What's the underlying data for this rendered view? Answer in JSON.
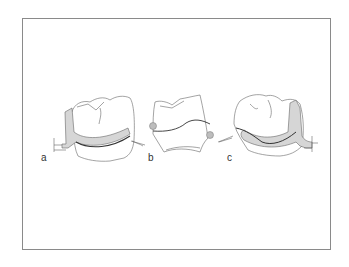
{
  "figure": {
    "panels": [
      {
        "id": "a",
        "label": "a",
        "description": "tooth with clasp arm (left view)"
      },
      {
        "id": "b",
        "label": "b",
        "description": "tooth with survey line (center view)"
      },
      {
        "id": "c",
        "label": "c",
        "description": "tooth with clasp arm (right view)"
      }
    ],
    "colors": {
      "line": "#555555",
      "clasp_fill": "#d6d6d6",
      "frame": "#8a8a8a",
      "rest_fill": "#bdbdbd"
    }
  }
}
